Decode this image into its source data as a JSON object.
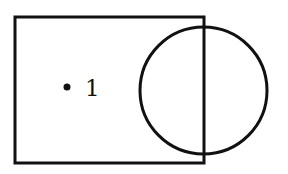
{
  "diagram": {
    "type": "venn-like",
    "canvas": {
      "width": 288,
      "height": 174,
      "background": "#ffffff"
    },
    "stroke_color": "#111111",
    "shapes": [
      {
        "kind": "rectangle",
        "name": "square-region",
        "x": 15,
        "y": 17,
        "width": 189,
        "height": 146,
        "stroke_width": 3
      },
      {
        "kind": "circle",
        "name": "circle-region",
        "cx": 203.5,
        "cy": 90.5,
        "r": 63.5,
        "stroke_width": 3
      }
    ],
    "points": [
      {
        "name": "point-1",
        "cx": 67,
        "cy": 87,
        "r": 3.5,
        "label": "1",
        "label_x": 85,
        "label_y": 96,
        "label_size": 23
      }
    ]
  }
}
